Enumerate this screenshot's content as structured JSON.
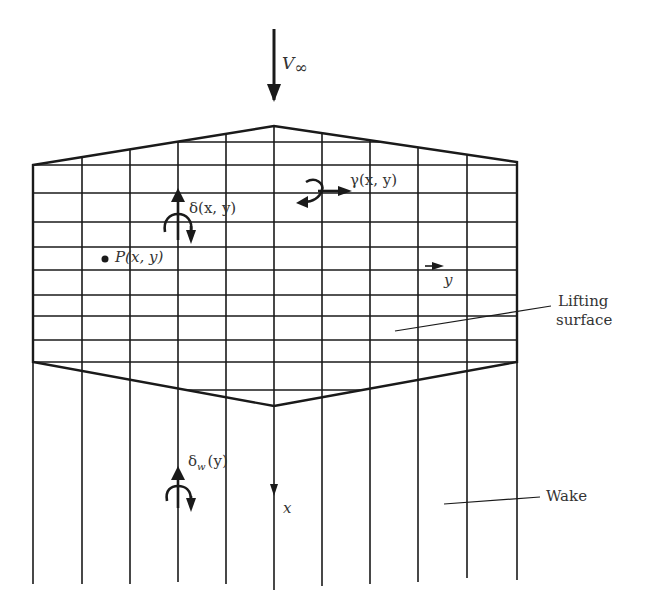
{
  "figure": {
    "freestream_label": "V",
    "freestream_subscript": "∞",
    "doublet_label": "δ(x, y)",
    "vortex_label": "γ(x, y)",
    "point_label": "P(x, y)",
    "y_axis_label": "y",
    "x_axis_label": "x",
    "wake_doublet_label": "δ",
    "wake_doublet_subscript": "w",
    "wake_doublet_arg": "(y)",
    "lifting_surface_label_line1": "Lifting",
    "lifting_surface_label_line2": "surface",
    "wake_label": "Wake"
  },
  "grid": {
    "x_lines": [
      33,
      82,
      130,
      178,
      226,
      274,
      322,
      370,
      418,
      467,
      517
    ],
    "y_lines": [
      165,
      193,
      222,
      247,
      270,
      295,
      316,
      340,
      362
    ],
    "leading_edge_apex": [
      274,
      126
    ],
    "trailing_edge_apex": [
      274,
      406
    ],
    "wake_end_y": [
      584,
      584,
      584,
      582,
      590,
      586,
      584,
      582,
      580,
      578,
      580
    ],
    "line_color": "#1a1a1a"
  }
}
